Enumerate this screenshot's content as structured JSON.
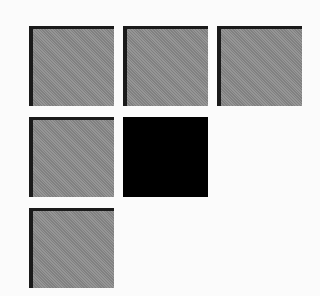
{
  "board": {
    "columns": 3,
    "rows": 3,
    "tile_colors": {
      "gray": "#8f8f8f",
      "black": "#000000",
      "background": "#fbfbfb"
    },
    "tiles": [
      {
        "row": 1,
        "col": 1,
        "color": "gray"
      },
      {
        "row": 1,
        "col": 2,
        "color": "gray"
      },
      {
        "row": 1,
        "col": 3,
        "color": "gray"
      },
      {
        "row": 2,
        "col": 1,
        "color": "gray"
      },
      {
        "row": 2,
        "col": 2,
        "color": "black"
      },
      {
        "row": 3,
        "col": 1,
        "color": "gray"
      }
    ]
  }
}
